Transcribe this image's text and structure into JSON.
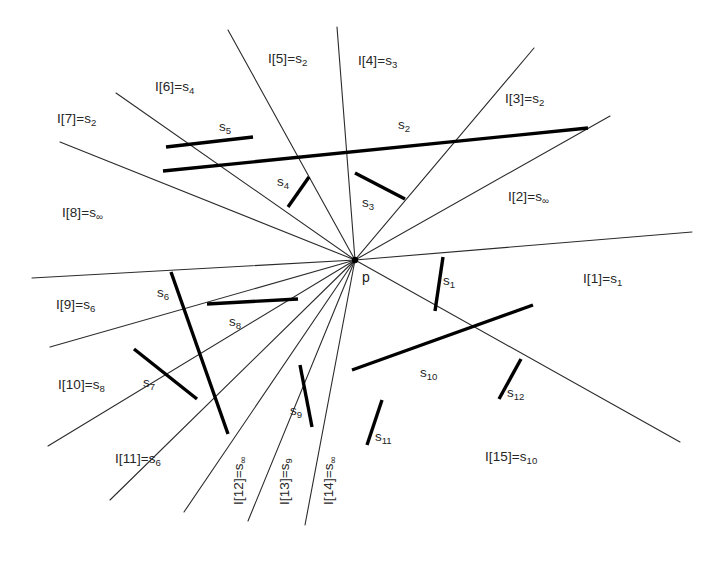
{
  "figure": {
    "type": "geometric-ray-diagram",
    "center_point": {
      "name": "p",
      "label": "p",
      "x": 355,
      "y": 260
    },
    "width": 718,
    "height": 571,
    "background_color": "#ffffff",
    "ray_color": "#2b2b2b",
    "segment_color": "#000000",
    "text_color": "#262626"
  },
  "rays": [
    {
      "id": "I1",
      "label_prefix": "I[1]=s",
      "label_sub": "1",
      "label": "I[1]=s1",
      "x1": 355,
      "y1": 260,
      "x2": 692,
      "y2": 232,
      "label_x": 583,
      "label_y": 272,
      "rotated": false
    },
    {
      "id": "I2",
      "label_prefix": "I[2]=s",
      "label_sub": "∞",
      "label": "I[2]=s∞",
      "x1": 355,
      "y1": 260,
      "x2": 610,
      "y2": 116,
      "label_x": 508,
      "label_y": 190,
      "rotated": false
    },
    {
      "id": "I3",
      "label_prefix": "I[3]=s",
      "label_sub": "2",
      "label": "I[3]=s2",
      "x1": 355,
      "y1": 260,
      "x2": 534,
      "y2": 48,
      "label_x": 505,
      "label_y": 92,
      "rotated": false
    },
    {
      "id": "I4",
      "label_prefix": "I[4]=s",
      "label_sub": "3",
      "label": "I[4]=s3",
      "x1": 355,
      "y1": 260,
      "x2": 337,
      "y2": 27,
      "label_x": 358,
      "label_y": 54,
      "rotated": false
    },
    {
      "id": "I5",
      "label_prefix": "I[5]=s",
      "label_sub": "2",
      "label": "I[5]=s2",
      "x1": 355,
      "y1": 260,
      "x2": 228,
      "y2": 30,
      "label_x": 268,
      "label_y": 52,
      "rotated": false
    },
    {
      "id": "I6",
      "label_prefix": "I[6]=s",
      "label_sub": "4",
      "label": "I[6]=s4",
      "x1": 355,
      "y1": 260,
      "x2": 116,
      "y2": 93,
      "label_x": 155,
      "label_y": 80,
      "rotated": false
    },
    {
      "id": "I7",
      "label_prefix": "I[7]=s",
      "label_sub": "2",
      "label": "I[7]=s2",
      "x1": 355,
      "y1": 260,
      "x2": 60,
      "y2": 142,
      "label_x": 57,
      "label_y": 112,
      "rotated": false
    },
    {
      "id": "I8",
      "label_prefix": "I[8]=s",
      "label_sub": "∞",
      "label": "I[8]=s∞",
      "x1": 355,
      "y1": 260,
      "x2": 32,
      "y2": 278,
      "label_x": 62,
      "label_y": 206,
      "rotated": false
    },
    {
      "id": "I9",
      "label_prefix": "I[9]=s",
      "label_sub": "6",
      "label": "I[9]=s6",
      "x1": 355,
      "y1": 260,
      "x2": 50,
      "y2": 347,
      "label_x": 56,
      "label_y": 298,
      "rotated": false
    },
    {
      "id": "I10",
      "label_prefix": "I[10]=s",
      "label_sub": "8",
      "label": "I[10]=s8",
      "x1": 355,
      "y1": 260,
      "x2": 48,
      "y2": 446,
      "label_x": 58,
      "label_y": 378,
      "rotated": false
    },
    {
      "id": "I11",
      "label_prefix": "I[11]=s",
      "label_sub": "6",
      "label": "I[11]=s6",
      "x1": 355,
      "y1": 260,
      "x2": 110,
      "y2": 500,
      "label_x": 115,
      "label_y": 452,
      "rotated": false
    },
    {
      "id": "I12",
      "label_prefix": "I[12]=s",
      "label_sub": "∞",
      "label": "I[12]=s∞",
      "x1": 355,
      "y1": 260,
      "x2": 184,
      "y2": 512,
      "label_x": 232,
      "label_y": 505,
      "rotated": true
    },
    {
      "id": "I13",
      "label_prefix": "I[13]=s",
      "label_sub": "9",
      "label": "I[13]=s9",
      "x1": 355,
      "y1": 260,
      "x2": 248,
      "y2": 521,
      "label_x": 278,
      "label_y": 505,
      "rotated": true
    },
    {
      "id": "I14",
      "label_prefix": "I[14]=s",
      "label_sub": "∞",
      "label": "I[14]=s∞",
      "x1": 355,
      "y1": 260,
      "x2": 305,
      "y2": 525,
      "label_x": 322,
      "label_y": 505,
      "rotated": true
    },
    {
      "id": "I15",
      "label_prefix": "I[15]=s",
      "label_sub": "10",
      "label": "I[15]=s10",
      "x1": 355,
      "y1": 260,
      "x2": 680,
      "y2": 442,
      "label_x": 485,
      "label_y": 450,
      "rotated": false
    }
  ],
  "segments": [
    {
      "id": "s1",
      "label_prefix": "s",
      "label_sub": "1",
      "label": "s1",
      "x1": 443,
      "y1": 257,
      "x2": 435,
      "y2": 311,
      "label_x": 443,
      "label_y": 274
    },
    {
      "id": "s2",
      "label_prefix": "s",
      "label_sub": "2",
      "label": "s2",
      "x1": 163,
      "y1": 171,
      "x2": 588,
      "y2": 128,
      "label_x": 398,
      "label_y": 118
    },
    {
      "id": "s3",
      "label_prefix": "s",
      "label_sub": "3",
      "label": "s3",
      "x1": 355,
      "y1": 173,
      "x2": 405,
      "y2": 199,
      "label_x": 362,
      "label_y": 196
    },
    {
      "id": "s4",
      "label_prefix": "s",
      "label_sub": "4",
      "label": "s4",
      "x1": 288,
      "y1": 207,
      "x2": 309,
      "y2": 177,
      "label_x": 277,
      "label_y": 175
    },
    {
      "id": "s5",
      "label_prefix": "s",
      "label_sub": "5",
      "label": "s5",
      "x1": 166,
      "y1": 147,
      "x2": 253,
      "y2": 137,
      "label_x": 219,
      "label_y": 120
    },
    {
      "id": "s6",
      "label_prefix": "s",
      "label_sub": "6",
      "label": "s6",
      "x1": 171,
      "y1": 272,
      "x2": 228,
      "y2": 434,
      "label_x": 157,
      "label_y": 286
    },
    {
      "id": "s7",
      "label_prefix": "s",
      "label_sub": "7",
      "label": "s7",
      "x1": 134,
      "y1": 349,
      "x2": 197,
      "y2": 399,
      "label_x": 143,
      "label_y": 376
    },
    {
      "id": "s8",
      "label_prefix": "s",
      "label_sub": "8",
      "label": "s8",
      "x1": 207,
      "y1": 304,
      "x2": 298,
      "y2": 299,
      "label_x": 229,
      "label_y": 315
    },
    {
      "id": "s9",
      "label_prefix": "s",
      "label_sub": "9",
      "label": "s9",
      "x1": 300,
      "y1": 365,
      "x2": 312,
      "y2": 427,
      "label_x": 290,
      "label_y": 404
    },
    {
      "id": "s10",
      "label_prefix": "s",
      "label_sub": "10",
      "label": "s10",
      "x1": 352,
      "y1": 370,
      "x2": 533,
      "y2": 305,
      "label_x": 420,
      "label_y": 366
    },
    {
      "id": "s11",
      "label_prefix": "s",
      "label_sub": "11",
      "label": "s11",
      "x1": 367,
      "y1": 445,
      "x2": 382,
      "y2": 400,
      "label_x": 375,
      "label_y": 430
    },
    {
      "id": "s12",
      "label_prefix": "s",
      "label_sub": "12",
      "label": "s12",
      "x1": 499,
      "y1": 399,
      "x2": 521,
      "y2": 359,
      "label_x": 507,
      "label_y": 386
    }
  ]
}
